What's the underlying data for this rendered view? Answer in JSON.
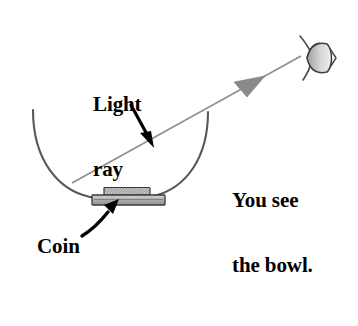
{
  "figure": {
    "background_color": "#ffffff",
    "width": 358,
    "height": 326
  },
  "labels": {
    "light_ray": "Light\nray",
    "light_ray_line1": "Light",
    "light_ray_line2": "ray",
    "you_see_the_bowl": "You see\nthe bowl.",
    "you_see_line1": "You see",
    "you_see_line2": "the bowl.",
    "coin": "Coin"
  },
  "colors": {
    "ink": "#000000",
    "ray_line": "#8d8d8d",
    "arrowhead_fill": "#8a8a8a",
    "bowl_outline": "#585858",
    "coin_fill": "#b5b5b5",
    "coin_outline": "#3a3a3a",
    "eye_outline": "#4a4a4a",
    "eye_fill": "#cfcfcf"
  },
  "elements": {
    "bowl": {
      "name": "bowl",
      "shape": "semicircular arc",
      "left_rim": [
        33,
        110
      ],
      "right_rim": [
        208,
        112
      ],
      "bottom": [
        120,
        196
      ]
    },
    "coin": {
      "name": "coin",
      "shape": "stacked rectangles",
      "top_plate": [
        104,
        188,
        46,
        7
      ],
      "body": [
        93,
        195,
        72,
        10
      ]
    },
    "light_ray": {
      "name": "light-ray",
      "from": [
        72,
        183
      ],
      "to": [
        300,
        57
      ],
      "arrowhead_at": [
        248,
        88
      ],
      "direction": "up-right toward eye"
    },
    "eye": {
      "name": "eye",
      "center": [
        311,
        58
      ],
      "lens": "almond",
      "pupil_side": "left"
    },
    "pointer_light_ray": {
      "name": "light-ray-pointer-arrow",
      "from": [
        132,
        106
      ],
      "to": [
        153,
        146
      ]
    },
    "pointer_coin": {
      "name": "coin-pointer-arrow",
      "from": [
        84,
        234
      ],
      "to": [
        119,
        199
      ]
    }
  }
}
